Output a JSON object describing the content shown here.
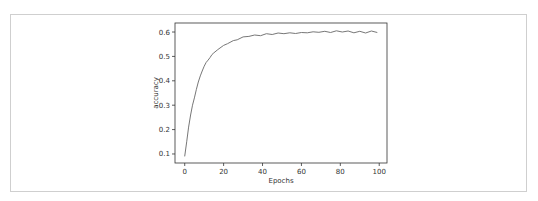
{
  "chart_data": {
    "type": "line",
    "title": "",
    "xlabel": "Epochs",
    "ylabel": "accuracy",
    "xlim": [
      -5,
      104
    ],
    "ylim": [
      0.063,
      0.637
    ],
    "xticks": [
      0,
      20,
      40,
      60,
      80,
      100
    ],
    "yticks": [
      0.1,
      0.2,
      0.3,
      0.4,
      0.5,
      0.6
    ],
    "grid": false,
    "legend": null,
    "series": [
      {
        "name": "accuracy",
        "color": "#777777",
        "x": [
          0,
          1,
          2,
          3,
          4,
          5,
          6,
          7,
          8,
          9,
          10,
          11,
          12,
          13,
          14,
          15,
          17,
          20,
          22,
          25,
          27,
          30,
          33,
          36,
          39,
          42,
          45,
          48,
          51,
          54,
          57,
          60,
          63,
          66,
          69,
          72,
          75,
          78,
          81,
          84,
          87,
          90,
          93,
          96,
          99
        ],
        "values": [
          0.09,
          0.15,
          0.21,
          0.26,
          0.3,
          0.33,
          0.365,
          0.395,
          0.42,
          0.44,
          0.46,
          0.475,
          0.485,
          0.495,
          0.508,
          0.515,
          0.528,
          0.545,
          0.552,
          0.565,
          0.568,
          0.58,
          0.582,
          0.588,
          0.585,
          0.593,
          0.59,
          0.596,
          0.593,
          0.597,
          0.594,
          0.598,
          0.597,
          0.601,
          0.599,
          0.603,
          0.598,
          0.605,
          0.6,
          0.604,
          0.597,
          0.603,
          0.596,
          0.604,
          0.598
        ]
      }
    ]
  }
}
